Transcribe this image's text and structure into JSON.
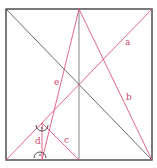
{
  "diagram": {
    "colors": {
      "frame": "#333333",
      "diagonal": "#444444",
      "midline": "#666666",
      "construction": "#e0557a",
      "label": "#d04a70",
      "angle_mark": "#222222"
    },
    "frame": {
      "x": 6,
      "y": 9,
      "w": 146,
      "h": 151
    },
    "lines": [
      {
        "name": "main-diagonal",
        "x1": 6,
        "y1": 9,
        "x2": 152,
        "y2": 160,
        "color": "diagonal"
      },
      {
        "name": "vertical-midline",
        "x1": 79,
        "y1": 9,
        "x2": 79,
        "y2": 160,
        "color": "midline"
      },
      {
        "name": "line-a",
        "x1": 6,
        "y1": 160,
        "x2": 152,
        "y2": 9,
        "color": "construction"
      },
      {
        "name": "line-b",
        "x1": 79,
        "y1": 9,
        "x2": 152,
        "y2": 160,
        "color": "construction"
      },
      {
        "name": "line-e",
        "x1": 79,
        "y1": 9,
        "x2": 42,
        "y2": 160,
        "color": "construction"
      },
      {
        "name": "line-c",
        "x1": 42,
        "y1": 123,
        "x2": 79,
        "y2": 160,
        "color": "construction"
      },
      {
        "name": "line-d",
        "x1": 42,
        "y1": 123,
        "x2": 42,
        "y2": 160,
        "color": "construction"
      }
    ],
    "labels": [
      {
        "name": "label-a",
        "text": "a",
        "x": 125,
        "y": 45
      },
      {
        "name": "label-b",
        "text": "b",
        "x": 126,
        "y": 100
      },
      {
        "name": "label-e",
        "text": "e",
        "x": 54,
        "y": 85
      },
      {
        "name": "label-c",
        "text": "c",
        "x": 64,
        "y": 143
      },
      {
        "name": "label-d",
        "text": "d",
        "x": 35,
        "y": 144
      }
    ],
    "right_angles": [
      {
        "name": "right-angle-top",
        "cx": 42,
        "cy": 127
      },
      {
        "name": "right-angle-bottom",
        "cx": 40,
        "cy": 158
      }
    ]
  }
}
